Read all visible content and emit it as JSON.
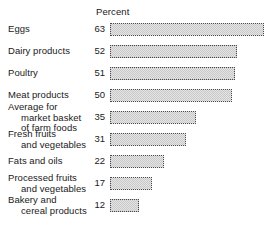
{
  "chart_data": {
    "type": "bar",
    "orientation": "horizontal",
    "title": "",
    "xlabel": "Percent",
    "ylabel": "",
    "axis_header": "Percent",
    "grid": false,
    "legend": null,
    "xlim": [
      0,
      63
    ],
    "value_labels_shown": true,
    "categories": [
      "Eggs",
      "Dairy products",
      "Poultry",
      "Meat products",
      "Average for market basket of farm foods",
      "Fresh fruits and vegetables",
      "Fats and oils",
      "Processed fruits and vegetables",
      "Bakery and cereal products"
    ],
    "values": [
      63,
      52,
      51,
      50,
      35,
      31,
      22,
      17,
      12
    ],
    "colors": {
      "bar_fill": "#e4e4e4",
      "bar_pattern": "#c9c9c9",
      "bar_border": "#4a4a4a",
      "text": "#1a1a1a",
      "background": "#ffffff"
    }
  },
  "rows": [
    {
      "label_lines": [
        {
          "text": "Eggs",
          "indent": false
        }
      ],
      "value": "63"
    },
    {
      "label_lines": [
        {
          "text": "Dairy products",
          "indent": false
        }
      ],
      "value": "52"
    },
    {
      "label_lines": [
        {
          "text": "Poultry",
          "indent": false
        }
      ],
      "value": "51"
    },
    {
      "label_lines": [
        {
          "text": "Meat products",
          "indent": false
        }
      ],
      "value": "50"
    },
    {
      "label_lines": [
        {
          "text": "Average for",
          "indent": false
        },
        {
          "text": "market basket",
          "indent": true
        },
        {
          "text": "of farm foods",
          "indent": true
        }
      ],
      "value": "35"
    },
    {
      "label_lines": [
        {
          "text": "Fresh fruits",
          "indent": false
        },
        {
          "text": "and vegetables",
          "indent": true
        }
      ],
      "value": "31"
    },
    {
      "label_lines": [
        {
          "text": "Fats and oils",
          "indent": false
        }
      ],
      "value": "22"
    },
    {
      "label_lines": [
        {
          "text": "Processed fruits",
          "indent": false
        },
        {
          "text": "and vegetables",
          "indent": true
        }
      ],
      "value": "17"
    },
    {
      "label_lines": [
        {
          "text": "Bakery and",
          "indent": false
        },
        {
          "text": "cereal products",
          "indent": true
        }
      ],
      "value": "12"
    }
  ]
}
